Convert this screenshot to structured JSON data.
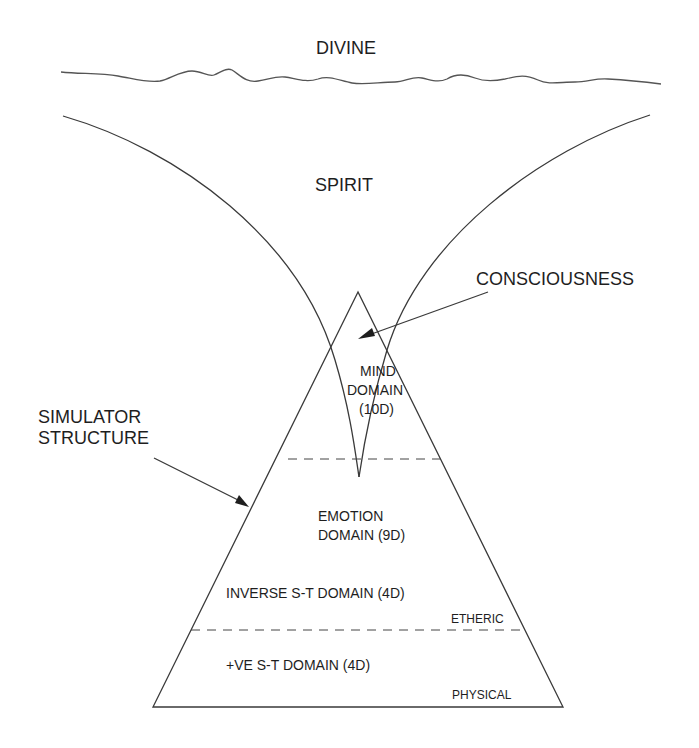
{
  "diagram": {
    "labels": {
      "divine": "DIVINE",
      "spirit": "SPIRIT",
      "consciousness": "CONSCIOUSNESS",
      "simulator_line1": "SIMULATOR",
      "simulator_line2": "STRUCTURE",
      "mind_line1": "MIND",
      "mind_line2": "DOMAIN",
      "mind_line3": "(10D)",
      "emotion_line1": "EMOTION",
      "emotion_line2": "DOMAIN (9D)",
      "inverse_st": "INVERSE S-T DOMAIN (4D)",
      "etheric": "ETHERIC",
      "positive_st": "+VE S-T DOMAIN (4D)",
      "physical": "PHYSICAL"
    },
    "colors": {
      "line": "#3a3a3a",
      "text": "#1e1e1e",
      "background": "#ffffff"
    }
  }
}
